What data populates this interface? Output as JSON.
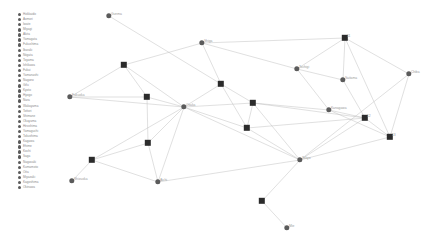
{
  "legend": {
    "name": "prefecture-legend",
    "items": [
      {
        "label": "Hokkaido"
      },
      {
        "label": "Aomori"
      },
      {
        "label": "Iwate"
      },
      {
        "label": "Miyagi"
      },
      {
        "label": "Akita"
      },
      {
        "label": "Yamagata"
      },
      {
        "label": "Fukushima"
      },
      {
        "label": "Ibaraki"
      },
      {
        "label": "Niigata"
      },
      {
        "label": "Toyama"
      },
      {
        "label": "Ishikawa"
      },
      {
        "label": "Fukui"
      },
      {
        "label": "Yamanashi"
      },
      {
        "label": "Nagano"
      },
      {
        "label": "Gifu"
      },
      {
        "label": "Kyoto"
      },
      {
        "label": "Hyogo"
      },
      {
        "label": "Nara"
      },
      {
        "label": "Wakayama"
      },
      {
        "label": "Tottori"
      },
      {
        "label": "Shimane"
      },
      {
        "label": "Okayama"
      },
      {
        "label": "Hiroshima"
      },
      {
        "label": "Yamaguchi"
      },
      {
        "label": "Tokushima"
      },
      {
        "label": "Kagawa"
      },
      {
        "label": "Ehime"
      },
      {
        "label": "Kochi"
      },
      {
        "label": "Saga"
      },
      {
        "label": "Nagasaki"
      },
      {
        "label": "Kumamoto"
      },
      {
        "label": "Oita"
      },
      {
        "label": "Miyazaki"
      },
      {
        "label": "Kagoshima"
      },
      {
        "label": "Okinawa"
      }
    ]
  },
  "graph": {
    "name": "prefecture-network",
    "node_colors": {
      "circle": "#5b5b5b",
      "square": "#2b2b2b"
    },
    "edge_color": "#b9b9b9",
    "nodes": [
      {
        "id": "gunma",
        "label": "Gunma",
        "shape": "circle",
        "x": 109,
        "y": 16
      },
      {
        "id": "shiga",
        "label": "Shiga",
        "shape": "circle",
        "x": 202,
        "y": 43
      },
      {
        "id": "n1",
        "label": "11",
        "shape": "square",
        "x": 345,
        "y": 38
      },
      {
        "id": "tochigi",
        "label": "Tochigi",
        "shape": "circle",
        "x": 297,
        "y": 69
      },
      {
        "id": "saitama",
        "label": "Saitama",
        "shape": "circle",
        "x": 343,
        "y": 80
      },
      {
        "id": "chiba",
        "label": "Chiba",
        "shape": "circle",
        "x": 409,
        "y": 74
      },
      {
        "id": "n2",
        "label": "",
        "shape": "square",
        "x": 124,
        "y": 65
      },
      {
        "id": "n3",
        "label": "",
        "shape": "square",
        "x": 221,
        "y": 84
      },
      {
        "id": "fukuoka",
        "label": "Fukuoka",
        "shape": "circle",
        "x": 70,
        "y": 97
      },
      {
        "id": "n4",
        "label": "",
        "shape": "square",
        "x": 147,
        "y": 97
      },
      {
        "id": "osaka",
        "label": "Osaka",
        "shape": "circle",
        "x": 184,
        "y": 107
      },
      {
        "id": "n5",
        "label": "",
        "shape": "square",
        "x": 253,
        "y": 103
      },
      {
        "id": "kanagawa",
        "label": "Kanagawa",
        "shape": "circle",
        "x": 329,
        "y": 110
      },
      {
        "id": "n6",
        "label": "12",
        "shape": "square",
        "x": 365,
        "y": 118
      },
      {
        "id": "n7",
        "label": "",
        "shape": "square",
        "x": 247,
        "y": 128
      },
      {
        "id": "n8",
        "label": "13",
        "shape": "square",
        "x": 390,
        "y": 137
      },
      {
        "id": "n9",
        "label": "",
        "shape": "square",
        "x": 148,
        "y": 143
      },
      {
        "id": "n10",
        "label": "",
        "shape": "square",
        "x": 92,
        "y": 160
      },
      {
        "id": "shizuoka",
        "label": "Shizuoka",
        "shape": "circle",
        "x": 72,
        "y": 181
      },
      {
        "id": "aichi",
        "label": "Aichi",
        "shape": "circle",
        "x": 158,
        "y": 182
      },
      {
        "id": "tokyo",
        "label": "Tokyo",
        "shape": "circle",
        "x": 300,
        "y": 160
      },
      {
        "id": "n11",
        "label": "",
        "shape": "square",
        "x": 262,
        "y": 201
      },
      {
        "id": "mie",
        "label": "Mie",
        "shape": "circle",
        "x": 287,
        "y": 228
      }
    ],
    "edges": [
      [
        "gunma",
        "n3"
      ],
      [
        "shiga",
        "n2"
      ],
      [
        "shiga",
        "n3"
      ],
      [
        "shiga",
        "n1"
      ],
      [
        "shiga",
        "tochigi"
      ],
      [
        "n1",
        "tochigi"
      ],
      [
        "n1",
        "saitama"
      ],
      [
        "n1",
        "chiba"
      ],
      [
        "n1",
        "n8"
      ],
      [
        "tochigi",
        "saitama"
      ],
      [
        "tochigi",
        "kanagawa"
      ],
      [
        "saitama",
        "n6"
      ],
      [
        "chiba",
        "n8"
      ],
      [
        "chiba",
        "tokyo"
      ],
      [
        "n2",
        "n4"
      ],
      [
        "n2",
        "osaka"
      ],
      [
        "n2",
        "fukuoka"
      ],
      [
        "n3",
        "osaka"
      ],
      [
        "n3",
        "n5"
      ],
      [
        "n3",
        "n7"
      ],
      [
        "fukuoka",
        "osaka"
      ],
      [
        "fukuoka",
        "n4"
      ],
      [
        "n4",
        "osaka"
      ],
      [
        "n4",
        "n9"
      ],
      [
        "osaka",
        "n5"
      ],
      [
        "osaka",
        "n7"
      ],
      [
        "osaka",
        "n9"
      ],
      [
        "osaka",
        "n10"
      ],
      [
        "osaka",
        "tokyo"
      ],
      [
        "osaka",
        "aichi"
      ],
      [
        "n5",
        "kanagawa"
      ],
      [
        "n5",
        "n6"
      ],
      [
        "n5",
        "n7"
      ],
      [
        "kanagawa",
        "n6"
      ],
      [
        "kanagawa",
        "n8"
      ],
      [
        "n6",
        "n8"
      ],
      [
        "n6",
        "tokyo"
      ],
      [
        "n7",
        "tokyo"
      ],
      [
        "n7",
        "n6"
      ],
      [
        "n8",
        "tokyo"
      ],
      [
        "n9",
        "n10"
      ],
      [
        "n9",
        "aichi"
      ],
      [
        "n10",
        "shizuoka"
      ],
      [
        "n10",
        "aichi"
      ],
      [
        "aichi",
        "tokyo"
      ],
      [
        "tokyo",
        "n11"
      ],
      [
        "tokyo",
        "n5"
      ],
      [
        "n11",
        "mie"
      ]
    ]
  }
}
